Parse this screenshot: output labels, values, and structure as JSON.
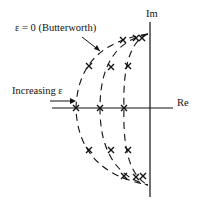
{
  "labels": {
    "butterworth": "ε = 0 (Butterworth)",
    "increasing": "Increasing ε",
    "im_axis": "Im",
    "re_axis": "Re"
  },
  "diagram": {
    "type": "pole-zero plot (s-plane)",
    "curves": 3,
    "poles_per_curve": 5
  }
}
